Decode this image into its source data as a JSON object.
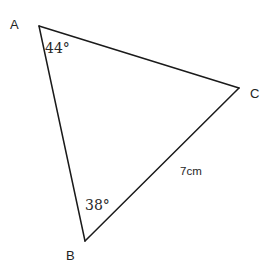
{
  "figure": {
    "type": "triangle-diagram",
    "width": 273,
    "height": 277,
    "background_color": "#ffffff",
    "stroke_color": "#1a1a1a",
    "stroke_width": 1.5
  },
  "chart_data": {
    "type": "diagram",
    "title": "",
    "shape": "triangle",
    "vertices": [
      {
        "name": "A",
        "x": 39,
        "y": 26
      },
      {
        "name": "B",
        "x": 85,
        "y": 241
      },
      {
        "name": "C",
        "x": 239,
        "y": 88
      }
    ],
    "edges": [
      {
        "from": "A",
        "to": "C"
      },
      {
        "from": "A",
        "to": "B"
      },
      {
        "from": "B",
        "to": "C"
      }
    ],
    "angles": [
      {
        "at": "A",
        "value": 44,
        "label": "44°"
      },
      {
        "at": "B",
        "value": 38,
        "label": "38°"
      }
    ],
    "side_lengths": [
      {
        "edge": "BC",
        "label": "7cm",
        "value": 7,
        "unit": "cm"
      }
    ]
  },
  "labels": {
    "vertex_a": "A",
    "vertex_b": "B",
    "vertex_c": "C",
    "angle_a": "44°",
    "angle_b": "38°",
    "side_bc": "7cm"
  }
}
